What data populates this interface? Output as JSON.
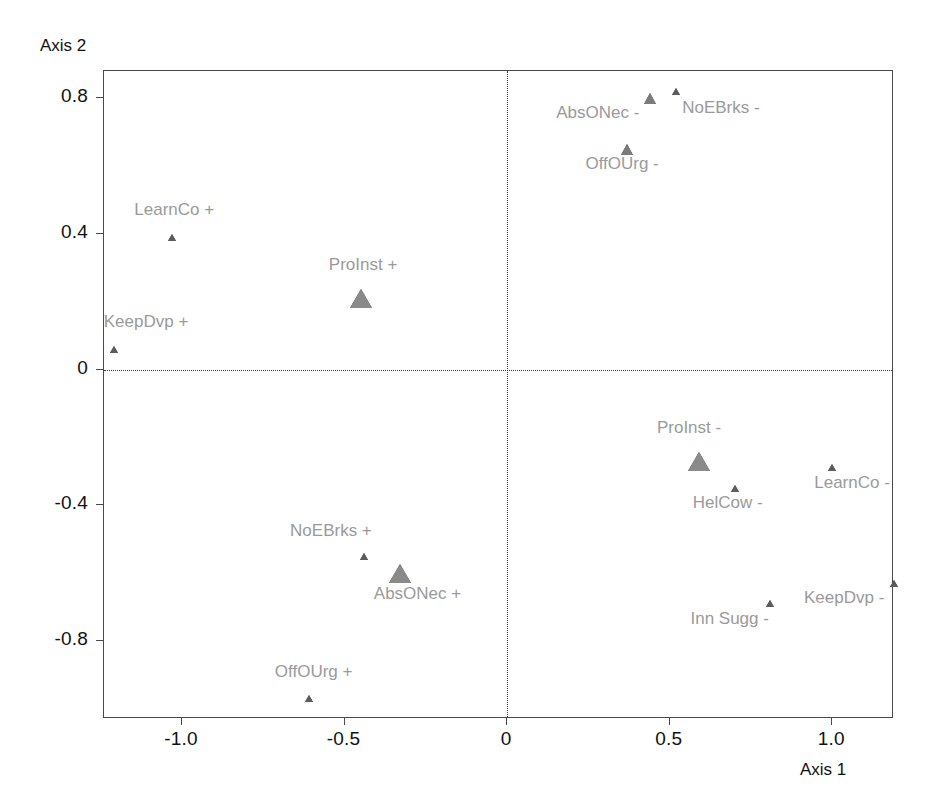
{
  "chart_data": {
    "type": "scatter",
    "title": "",
    "xlabel": "Axis 1",
    "ylabel": "Axis 2",
    "xlim": [
      -1.24,
      1.19
    ],
    "ylim": [
      -1.03,
      0.88
    ],
    "xticks": [
      "-1.0",
      "-0.5",
      "0",
      "0.5",
      "1.0"
    ],
    "xtick_values": [
      -1.0,
      -0.5,
      0,
      0.5,
      1.0
    ],
    "yticks": [
      "0.8",
      "0.4",
      "0",
      "-0.4",
      "-0.8"
    ],
    "ytick_values": [
      0.8,
      0.4,
      0,
      -0.4,
      -0.8
    ],
    "grid": false,
    "zero_lines": true,
    "legend": "none",
    "marker": "triangle",
    "marker_color": "#7c7c7c",
    "label_color": "#9a9a9a",
    "points": [
      {
        "label": "AbsONec -",
        "x": 0.44,
        "y": 0.8,
        "size": "medium",
        "label_dx": -94,
        "label_dy": 14
      },
      {
        "label": "NoEBrks -",
        "x": 0.52,
        "y": 0.82,
        "size": "small",
        "label_dx": 6,
        "label_dy": 16
      },
      {
        "label": "OffOUrg -",
        "x": 0.37,
        "y": 0.65,
        "size": "medium",
        "label_dx": -42,
        "label_dy": 14
      },
      {
        "label": "LearnCo +",
        "x": -1.03,
        "y": 0.39,
        "size": "small",
        "label_dx": -38,
        "label_dy": -28
      },
      {
        "label": "ProInst +",
        "x": -0.45,
        "y": 0.21,
        "size": "large",
        "label_dx": -32,
        "label_dy": -34
      },
      {
        "label": "KeepDvp +",
        "x": -1.21,
        "y": 0.06,
        "size": "small",
        "label_dx": -10,
        "label_dy": -28
      },
      {
        "label": "ProInst -",
        "x": 0.59,
        "y": -0.27,
        "size": "large",
        "label_dx": -42,
        "label_dy": -34
      },
      {
        "label": "LearnCo -",
        "x": 1.0,
        "y": -0.29,
        "size": "small",
        "label_dx": -18,
        "label_dy": 14
      },
      {
        "label": "HelCow -",
        "x": 0.7,
        "y": -0.35,
        "size": "small",
        "label_dx": -42,
        "label_dy": 14
      },
      {
        "label": "NoEBrks +",
        "x": -0.44,
        "y": -0.55,
        "size": "small",
        "label_dx": -74,
        "label_dy": -26
      },
      {
        "label": "AbsONec +",
        "x": -0.33,
        "y": -0.6,
        "size": "large",
        "label_dx": -26,
        "label_dy": 20
      },
      {
        "label": "Inn Sugg -",
        "x": 0.81,
        "y": -0.69,
        "size": "small",
        "label_dx": -80,
        "label_dy": 14
      },
      {
        "label": "KeepDvp -",
        "x": 1.19,
        "y": -0.63,
        "size": "small",
        "label_dx": -90,
        "label_dy": 14
      },
      {
        "label": "OffOUrg +",
        "x": -0.61,
        "y": -0.97,
        "size": "small",
        "label_dx": -34,
        "label_dy": -28
      }
    ]
  }
}
